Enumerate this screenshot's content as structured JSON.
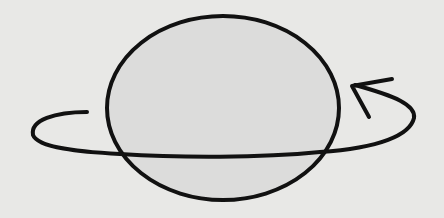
{
  "diagram": {
    "description": "Hand-drawn sphere with a counter-clockwise rotation arrow orbiting around it",
    "colors": {
      "background": "#e8e8e6",
      "sphere_fill": "#dcdcdb",
      "stroke": "#111111"
    },
    "elements": [
      {
        "type": "sphere",
        "shape": "ellipse",
        "cx": 223,
        "cy": 108,
        "rx": 117,
        "ry": 92
      },
      {
        "type": "rotation-arrow",
        "direction": "counter-clockwise",
        "arrowhead": "upper-right"
      }
    ]
  }
}
